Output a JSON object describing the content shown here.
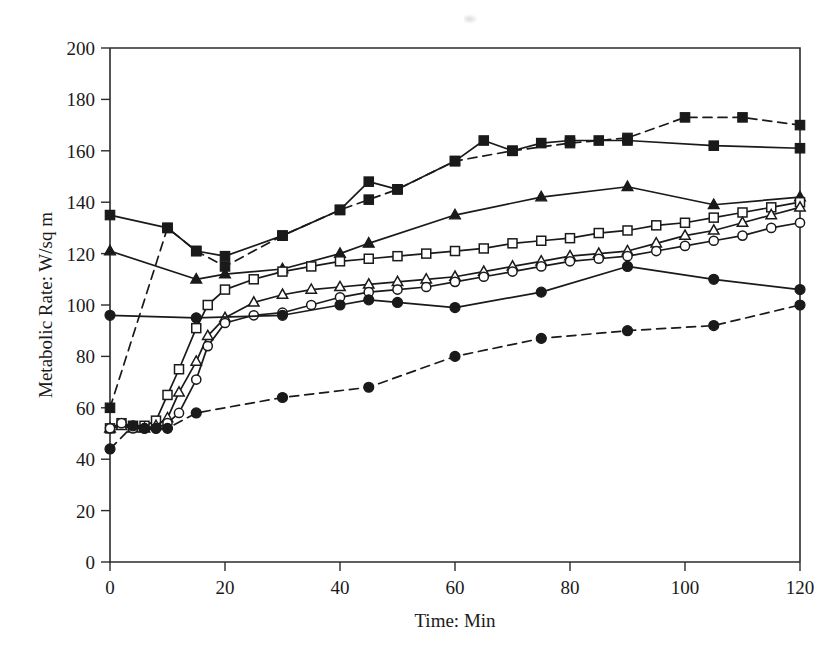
{
  "chart_data": {
    "type": "line",
    "title": "",
    "xlabel": "Time: Min",
    "ylabel": "Metabolic Rate: W/sq m",
    "xlim": [
      0,
      120
    ],
    "ylim": [
      0,
      200
    ],
    "xticks": [
      0,
      20,
      40,
      60,
      80,
      100,
      120
    ],
    "yticks": [
      0,
      20,
      40,
      60,
      80,
      100,
      120,
      140,
      160,
      180,
      200
    ],
    "grid": false,
    "legend": "none",
    "axis_color": "#1a1a1a",
    "series": [
      {
        "name": "filled-square-solid",
        "marker": "filled-square",
        "linestyle": "solid",
        "points": [
          [
            0,
            135
          ],
          [
            10,
            130
          ],
          [
            15,
            121
          ],
          [
            20,
            119
          ],
          [
            30,
            127
          ],
          [
            40,
            137
          ],
          [
            45,
            148
          ],
          [
            50,
            145
          ],
          [
            60,
            156
          ],
          [
            65,
            164
          ],
          [
            70,
            160
          ],
          [
            75,
            163
          ],
          [
            80,
            164
          ],
          [
            85,
            164
          ],
          [
            90,
            164
          ],
          [
            105,
            162
          ],
          [
            120,
            161
          ]
        ]
      },
      {
        "name": "filled-square-dashed",
        "marker": "filled-square",
        "linestyle": "dashed",
        "points": [
          [
            0,
            60
          ],
          [
            10,
            130
          ],
          [
            15,
            121
          ],
          [
            20,
            115
          ],
          [
            30,
            127
          ],
          [
            40,
            137
          ],
          [
            45,
            141
          ],
          [
            50,
            145
          ],
          [
            60,
            156
          ],
          [
            70,
            160
          ],
          [
            80,
            163
          ],
          [
            90,
            165
          ],
          [
            100,
            173
          ],
          [
            110,
            173
          ],
          [
            120,
            170
          ]
        ]
      },
      {
        "name": "filled-triangle-solid",
        "marker": "filled-triangle",
        "linestyle": "solid",
        "points": [
          [
            0,
            121
          ],
          [
            15,
            110
          ],
          [
            20,
            112
          ],
          [
            30,
            114
          ],
          [
            40,
            120
          ],
          [
            45,
            124
          ],
          [
            60,
            135
          ],
          [
            75,
            142
          ],
          [
            90,
            146
          ],
          [
            105,
            139
          ],
          [
            120,
            142
          ]
        ]
      },
      {
        "name": "open-square-solid",
        "marker": "open-square",
        "linestyle": "solid",
        "points": [
          [
            0,
            52
          ],
          [
            2,
            54
          ],
          [
            4,
            53
          ],
          [
            6,
            53
          ],
          [
            8,
            55
          ],
          [
            10,
            65
          ],
          [
            12,
            75
          ],
          [
            15,
            91
          ],
          [
            17,
            100
          ],
          [
            20,
            106
          ],
          [
            25,
            110
          ],
          [
            30,
            113
          ],
          [
            35,
            115
          ],
          [
            40,
            117
          ],
          [
            45,
            118
          ],
          [
            50,
            119
          ],
          [
            55,
            120
          ],
          [
            60,
            121
          ],
          [
            65,
            122
          ],
          [
            70,
            124
          ],
          [
            75,
            125
          ],
          [
            80,
            126
          ],
          [
            85,
            128
          ],
          [
            90,
            129
          ],
          [
            95,
            131
          ],
          [
            100,
            132
          ],
          [
            105,
            134
          ],
          [
            110,
            136
          ],
          [
            115,
            138
          ],
          [
            120,
            140
          ]
        ]
      },
      {
        "name": "open-triangle-solid",
        "marker": "open-triangle",
        "linestyle": "solid",
        "points": [
          [
            0,
            52
          ],
          [
            2,
            53
          ],
          [
            4,
            52
          ],
          [
            6,
            52
          ],
          [
            8,
            53
          ],
          [
            10,
            56
          ],
          [
            12,
            66
          ],
          [
            15,
            78
          ],
          [
            17,
            88
          ],
          [
            20,
            95
          ],
          [
            25,
            101
          ],
          [
            30,
            104
          ],
          [
            35,
            106
          ],
          [
            40,
            107
          ],
          [
            45,
            108
          ],
          [
            50,
            109
          ],
          [
            55,
            110
          ],
          [
            60,
            111
          ],
          [
            65,
            113
          ],
          [
            70,
            115
          ],
          [
            75,
            117
          ],
          [
            80,
            119
          ],
          [
            85,
            120
          ],
          [
            90,
            121
          ],
          [
            95,
            124
          ],
          [
            100,
            127
          ],
          [
            105,
            129
          ],
          [
            110,
            132
          ],
          [
            115,
            135
          ],
          [
            120,
            138
          ]
        ]
      },
      {
        "name": "open-circle-solid",
        "marker": "open-circle",
        "linestyle": "solid",
        "points": [
          [
            0,
            52
          ],
          [
            2,
            54
          ],
          [
            4,
            52
          ],
          [
            6,
            52
          ],
          [
            8,
            52
          ],
          [
            10,
            54
          ],
          [
            12,
            58
          ],
          [
            15,
            71
          ],
          [
            17,
            84
          ],
          [
            20,
            93
          ],
          [
            25,
            96
          ],
          [
            30,
            97
          ],
          [
            35,
            100
          ],
          [
            40,
            103
          ],
          [
            45,
            105
          ],
          [
            50,
            106
          ],
          [
            55,
            107
          ],
          [
            60,
            109
          ],
          [
            65,
            111
          ],
          [
            70,
            113
          ],
          [
            75,
            115
          ],
          [
            80,
            117
          ],
          [
            85,
            118
          ],
          [
            90,
            119
          ],
          [
            95,
            121
          ],
          [
            100,
            123
          ],
          [
            105,
            125
          ],
          [
            110,
            127
          ],
          [
            115,
            130
          ],
          [
            120,
            132
          ]
        ]
      },
      {
        "name": "filled-circle-solid",
        "marker": "filled-circle",
        "linestyle": "solid",
        "points": [
          [
            0,
            96
          ],
          [
            15,
            95
          ],
          [
            30,
            96
          ],
          [
            40,
            100
          ],
          [
            45,
            102
          ],
          [
            50,
            101
          ],
          [
            60,
            99
          ],
          [
            75,
            105
          ],
          [
            90,
            115
          ],
          [
            105,
            110
          ],
          [
            120,
            106
          ]
        ]
      },
      {
        "name": "filled-circle-dashed",
        "marker": "filled-circle",
        "linestyle": "dashed",
        "points": [
          [
            0,
            44
          ],
          [
            4,
            53
          ],
          [
            6,
            52
          ],
          [
            8,
            52
          ],
          [
            10,
            52
          ],
          [
            15,
            58
          ],
          [
            30,
            64
          ],
          [
            45,
            68
          ],
          [
            60,
            80
          ],
          [
            75,
            87
          ],
          [
            90,
            90
          ],
          [
            105,
            92
          ],
          [
            120,
            100
          ]
        ]
      }
    ]
  },
  "page": {
    "background": "#ffffff",
    "ink": "#1a1a1a"
  }
}
